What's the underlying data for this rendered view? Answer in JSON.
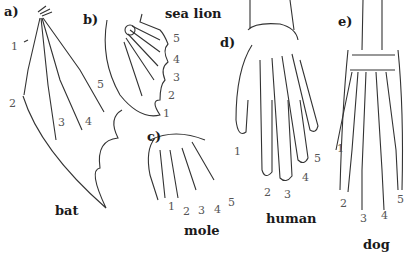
{
  "figure": {
    "panels": [
      {
        "id": "a",
        "label": "a)",
        "name": "bat",
        "digits": [
          "1",
          "2",
          "3",
          "4",
          "5"
        ]
      },
      {
        "id": "b",
        "label": "b)",
        "name": "sea lion",
        "digits": [
          "5",
          "4",
          "3",
          "2",
          "1"
        ]
      },
      {
        "id": "c",
        "label": "c)",
        "name": "mole",
        "digits": [
          "1",
          "2",
          "3",
          "4",
          "5"
        ]
      },
      {
        "id": "d",
        "label": "d)",
        "name": "human",
        "digits": [
          "1",
          "2",
          "3",
          "4",
          "5"
        ]
      },
      {
        "id": "e",
        "label": "e)",
        "name": "dog",
        "digits": [
          "1",
          "2",
          "3",
          "4",
          "5"
        ]
      }
    ]
  }
}
